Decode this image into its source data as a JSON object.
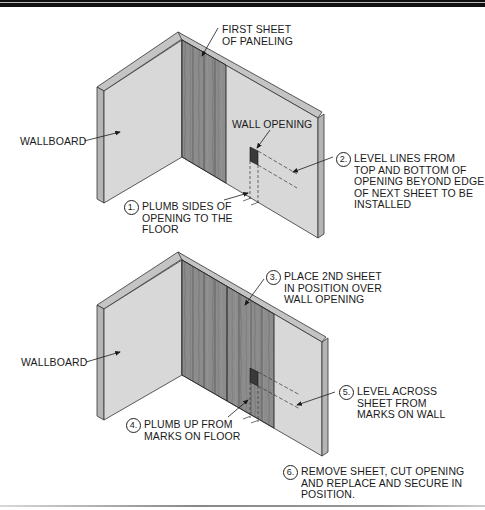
{
  "figure": {
    "panels": [
      {
        "id": "top",
        "labels": {
          "first_sheet": [
            "FIRST SHEET",
            "OF PANELING"
          ],
          "wallboard": "WALLBOARD",
          "wall_opening": "WALL OPENING"
        },
        "steps": [
          {
            "number": "1.",
            "lines": [
              "PLUMB SIDES OF",
              "OPENING TO THE",
              "FLOOR"
            ]
          },
          {
            "number": "2.",
            "lines": [
              "LEVEL LINES FROM",
              "TOP AND BOTTOM OF",
              "OPENING BEYOND EDGE",
              "OF NEXT SHEET TO BE",
              "INSTALLED"
            ]
          }
        ]
      },
      {
        "id": "bottom",
        "labels": {
          "wallboard": "WALLBOARD"
        },
        "steps": [
          {
            "number": "3.",
            "lines": [
              "PLACE 2ND SHEET",
              "IN POSITION OVER",
              "WALL OPENING"
            ]
          },
          {
            "number": "4.",
            "lines": [
              "PLUMB UP FROM",
              "MARKS ON FLOOR"
            ]
          },
          {
            "number": "5.",
            "lines": [
              "LEVEL ACROSS",
              "SHEET FROM",
              "MARKS ON WALL"
            ]
          },
          {
            "number": "6.",
            "lines": [
              "REMOVE SHEET, CUT OPENING",
              "AND REPLACE AND SECURE IN",
              "POSITION."
            ]
          }
        ]
      }
    ],
    "colors": {
      "wallboard_face": "#d6d6d6",
      "wallboard_edge": "#b9b9b9",
      "paneling": "#8a8a8a",
      "paneling_dark": "#5f5f5f",
      "opening": "#3a3a3a",
      "ink": "#1a1a1a"
    }
  }
}
